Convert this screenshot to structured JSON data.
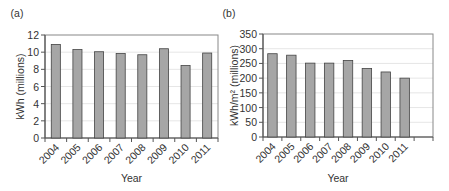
{
  "colors": {
    "bar_fill": "#a6a6a6",
    "bar_stroke": "#444444",
    "axis": "#555555",
    "grid": "#e6e6e6",
    "frame": "#888888"
  },
  "chart_data": [
    {
      "type": "bar",
      "panel_label": "(a)",
      "title": "",
      "categories": [
        "2004",
        "2005",
        "2006",
        "2007",
        "2008",
        "2009",
        "2010",
        "2011"
      ],
      "values": [
        10.9,
        10.3,
        10.05,
        9.85,
        9.7,
        10.4,
        8.45,
        9.9
      ],
      "xlabel": "Year",
      "ylabel": "kWh (millions)",
      "ylim": [
        0,
        12
      ],
      "yticks": [
        0,
        2,
        4,
        6,
        8,
        10,
        12
      ],
      "grid": true,
      "legend": null
    },
    {
      "type": "bar",
      "panel_label": "(b)",
      "title": "",
      "categories": [
        "2004",
        "2005",
        "2006",
        "2007",
        "2008",
        "2009",
        "2010",
        "2011",
        ""
      ],
      "values": [
        283,
        278,
        251,
        251,
        260,
        233,
        221,
        200,
        null
      ],
      "xlabel": "Year",
      "ylabel": "kWh/m² (millions)",
      "ylim": [
        0,
        350
      ],
      "yticks": [
        0,
        50,
        100,
        150,
        200,
        250,
        300,
        350
      ],
      "grid": true,
      "legend": null
    }
  ]
}
